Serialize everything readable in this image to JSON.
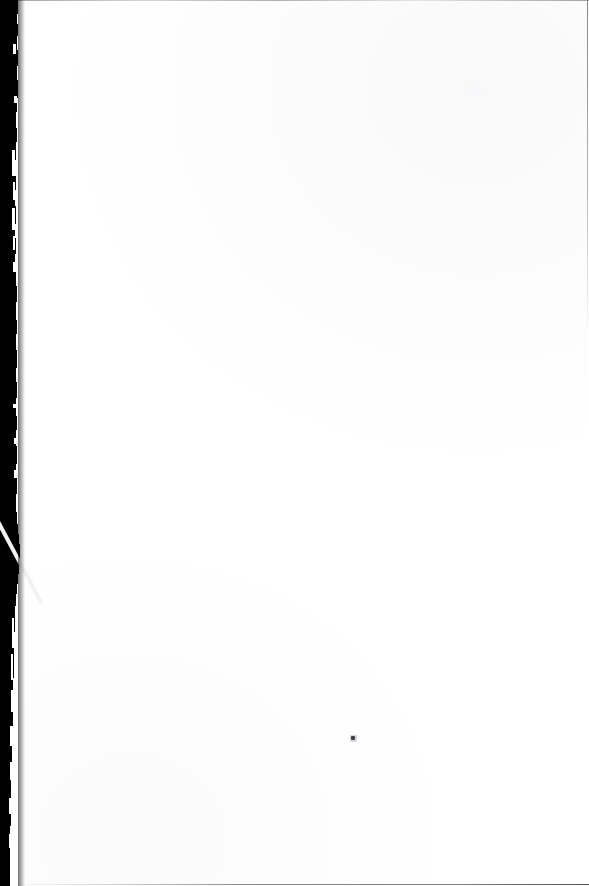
{
  "document": {
    "kind": "scanned-page",
    "page_state": "blank",
    "visible_text": "",
    "page_width_px": 589,
    "page_height_px": 886,
    "paper_color": "#ffffff",
    "gutter_color": "#000000",
    "edge_line_color": "#c9c9cb",
    "speck_color": "#3f3f46"
  },
  "marks": {
    "ink_speck": {
      "name": "ink-speck",
      "x": 351,
      "y": 736,
      "width": 4,
      "height": 4
    }
  },
  "edges": {
    "top_rule": {
      "x": 18,
      "y": 0,
      "width": 571,
      "height": 1
    },
    "right_rule": {
      "x": 587,
      "y": 0,
      "width": 1,
      "height": 340
    },
    "bottom_rule": {
      "x": 12,
      "y": 884,
      "width": 577,
      "height": 1
    }
  },
  "gutter": {
    "name": "scan-gutter",
    "slices": [
      {
        "y": 0,
        "h": 14,
        "w": 18
      },
      {
        "y": 14,
        "h": 10,
        "w": 17
      },
      {
        "y": 24,
        "h": 12,
        "w": 18
      },
      {
        "y": 36,
        "h": 14,
        "w": 17
      },
      {
        "y": 50,
        "h": 16,
        "w": 18
      },
      {
        "y": 66,
        "h": 14,
        "w": 17
      },
      {
        "y": 80,
        "h": 18,
        "w": 18
      },
      {
        "y": 98,
        "h": 14,
        "w": 17
      },
      {
        "y": 112,
        "h": 16,
        "w": 16
      },
      {
        "y": 128,
        "h": 14,
        "w": 17
      },
      {
        "y": 142,
        "h": 18,
        "w": 16
      },
      {
        "y": 160,
        "h": 16,
        "w": 15
      },
      {
        "y": 176,
        "h": 14,
        "w": 16
      },
      {
        "y": 190,
        "h": 16,
        "w": 15
      },
      {
        "y": 206,
        "h": 18,
        "w": 16
      },
      {
        "y": 224,
        "h": 14,
        "w": 15
      },
      {
        "y": 238,
        "h": 16,
        "w": 16
      },
      {
        "y": 254,
        "h": 18,
        "w": 15
      },
      {
        "y": 272,
        "h": 14,
        "w": 16
      },
      {
        "y": 286,
        "h": 16,
        "w": 17
      },
      {
        "y": 302,
        "h": 18,
        "w": 16
      },
      {
        "y": 320,
        "h": 14,
        "w": 17
      },
      {
        "y": 334,
        "h": 16,
        "w": 16
      },
      {
        "y": 350,
        "h": 18,
        "w": 17
      },
      {
        "y": 368,
        "h": 14,
        "w": 16
      },
      {
        "y": 382,
        "h": 16,
        "w": 17
      },
      {
        "y": 398,
        "h": 18,
        "w": 16
      },
      {
        "y": 416,
        "h": 14,
        "w": 17
      },
      {
        "y": 430,
        "h": 16,
        "w": 16
      },
      {
        "y": 446,
        "h": 18,
        "w": 17
      },
      {
        "y": 464,
        "h": 14,
        "w": 16
      },
      {
        "y": 478,
        "h": 16,
        "w": 17
      },
      {
        "y": 494,
        "h": 18,
        "w": 16
      },
      {
        "y": 512,
        "h": 12,
        "w": 17
      },
      {
        "y": 524,
        "h": 10,
        "w": 18
      },
      {
        "y": 534,
        "h": 10,
        "w": 19
      },
      {
        "y": 544,
        "h": 10,
        "w": 20
      },
      {
        "y": 554,
        "h": 10,
        "w": 20
      },
      {
        "y": 564,
        "h": 10,
        "w": 19
      },
      {
        "y": 574,
        "h": 10,
        "w": 18
      },
      {
        "y": 584,
        "h": 10,
        "w": 17
      },
      {
        "y": 594,
        "h": 12,
        "w": 16
      },
      {
        "y": 606,
        "h": 12,
        "w": 15
      },
      {
        "y": 618,
        "h": 14,
        "w": 15
      },
      {
        "y": 632,
        "h": 14,
        "w": 14
      },
      {
        "y": 646,
        "h": 16,
        "w": 14
      },
      {
        "y": 662,
        "h": 16,
        "w": 14
      },
      {
        "y": 678,
        "h": 16,
        "w": 13
      },
      {
        "y": 694,
        "h": 16,
        "w": 13
      },
      {
        "y": 710,
        "h": 16,
        "w": 13
      },
      {
        "y": 726,
        "h": 16,
        "w": 12
      },
      {
        "y": 742,
        "h": 16,
        "w": 12
      },
      {
        "y": 758,
        "h": 16,
        "w": 12
      },
      {
        "y": 774,
        "h": 16,
        "w": 11
      },
      {
        "y": 790,
        "h": 18,
        "w": 11
      },
      {
        "y": 808,
        "h": 18,
        "w": 11
      },
      {
        "y": 826,
        "h": 18,
        "w": 10
      },
      {
        "y": 844,
        "h": 20,
        "w": 10
      },
      {
        "y": 864,
        "h": 22,
        "w": 10
      }
    ],
    "nicks": [
      {
        "x": 13,
        "y": 44,
        "w": 3,
        "h": 10
      },
      {
        "x": 14,
        "y": 96,
        "w": 3,
        "h": 7
      },
      {
        "x": 12,
        "y": 150,
        "w": 3,
        "h": 26
      },
      {
        "x": 13,
        "y": 182,
        "w": 2,
        "h": 18
      },
      {
        "x": 12,
        "y": 208,
        "w": 3,
        "h": 22
      },
      {
        "x": 13,
        "y": 236,
        "w": 2,
        "h": 14
      },
      {
        "x": 13,
        "y": 262,
        "w": 2,
        "h": 10
      },
      {
        "x": 13,
        "y": 404,
        "w": 3,
        "h": 4
      },
      {
        "x": 14,
        "y": 438,
        "w": 2,
        "h": 6
      },
      {
        "x": 14,
        "y": 470,
        "w": 2,
        "h": 8
      },
      {
        "x": 12,
        "y": 618,
        "w": 2,
        "h": 30
      },
      {
        "x": 11,
        "y": 654,
        "w": 2,
        "h": 26
      },
      {
        "x": 11,
        "y": 690,
        "w": 2,
        "h": 22
      },
      {
        "x": 10,
        "y": 726,
        "w": 2,
        "h": 20
      },
      {
        "x": 10,
        "y": 762,
        "w": 2,
        "h": 18
      },
      {
        "x": 9,
        "y": 798,
        "w": 2,
        "h": 16
      },
      {
        "x": 9,
        "y": 834,
        "w": 2,
        "h": 14
      }
    ],
    "streak": {
      "x": 0,
      "y": 521,
      "length": 92,
      "thickness": 4,
      "angle_deg": 62
    }
  }
}
